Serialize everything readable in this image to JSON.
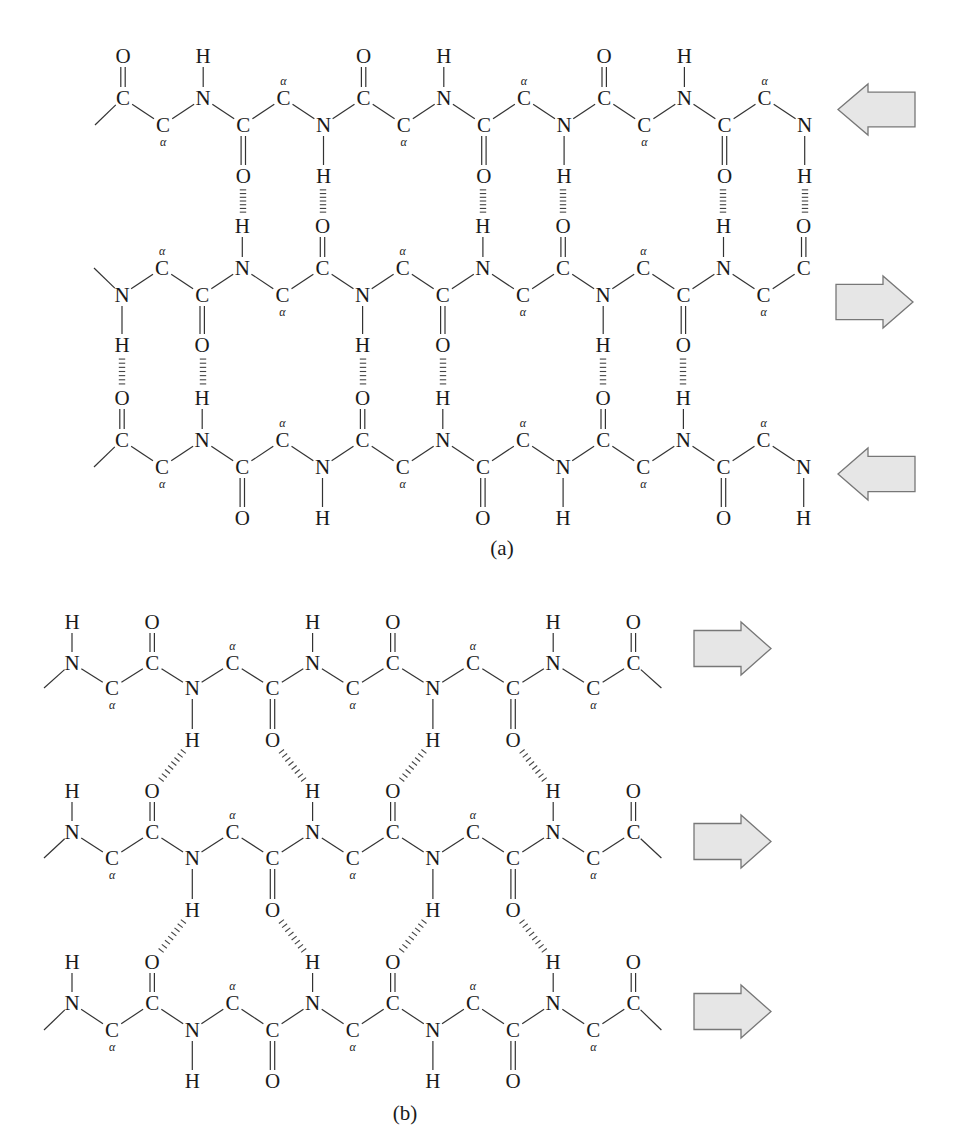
{
  "figure": {
    "colors": {
      "ink": "#1a1a1a",
      "bond": "#333333",
      "arrow_fill": "#e6e6e6",
      "arrow_stroke": "#777777"
    },
    "panels": [
      {
        "id": "a",
        "label": "(a)",
        "label_pos": [
          502,
          555
        ],
        "type": "antiparallel",
        "strands": [
          {
            "direction": "left",
            "y_up": 98,
            "y_dn": 125,
            "y_above": 56,
            "y_below": 176,
            "x0": 123,
            "dx": 40.1,
            "lead_in": "left",
            "atoms": [
              {
                "el": "C",
                "pos": "up",
                "sub": "O"
              },
              {
                "el": "C",
                "pos": "dn",
                "alpha": true
              },
              {
                "el": "N",
                "pos": "up",
                "sub": "H"
              },
              {
                "el": "C",
                "pos": "dn",
                "sub": "O"
              },
              {
                "el": "C",
                "pos": "up",
                "alpha": true
              },
              {
                "el": "N",
                "pos": "dn",
                "sub": "H"
              },
              {
                "el": "C",
                "pos": "up",
                "sub": "O"
              },
              {
                "el": "C",
                "pos": "dn",
                "alpha": true
              },
              {
                "el": "N",
                "pos": "up",
                "sub": "H"
              },
              {
                "el": "C",
                "pos": "dn",
                "sub": "O"
              },
              {
                "el": "C",
                "pos": "up",
                "alpha": true
              },
              {
                "el": "N",
                "pos": "dn",
                "sub": "H"
              },
              {
                "el": "C",
                "pos": "up",
                "sub": "O"
              },
              {
                "el": "C",
                "pos": "dn",
                "alpha": true
              },
              {
                "el": "N",
                "pos": "up",
                "sub": "H"
              },
              {
                "el": "C",
                "pos": "dn",
                "sub": "O"
              },
              {
                "el": "C",
                "pos": "up",
                "alpha": true
              },
              {
                "el": "N",
                "pos": "dn",
                "sub": "H"
              }
            ],
            "arrow": {
              "dir": "left",
              "x": 838,
              "y": 84,
              "w": 77,
              "h": 51
            }
          },
          {
            "direction": "right",
            "y_up": 268,
            "y_dn": 295,
            "y_above": 226,
            "y_below": 345,
            "x0": 122,
            "dx": 40.1,
            "lead_in": "left",
            "atoms": [
              {
                "el": "N",
                "pos": "dn",
                "sub": "H"
              },
              {
                "el": "C",
                "pos": "up",
                "alpha": true
              },
              {
                "el": "C",
                "pos": "dn",
                "sub": "O"
              },
              {
                "el": "N",
                "pos": "up",
                "sub": "H"
              },
              {
                "el": "C",
                "pos": "dn",
                "alpha": true
              },
              {
                "el": "C",
                "pos": "up",
                "sub": "O"
              },
              {
                "el": "N",
                "pos": "dn",
                "sub": "H"
              },
              {
                "el": "C",
                "pos": "up",
                "alpha": true
              },
              {
                "el": "C",
                "pos": "dn",
                "sub": "O"
              },
              {
                "el": "N",
                "pos": "up",
                "sub": "H"
              },
              {
                "el": "C",
                "pos": "dn",
                "alpha": true
              },
              {
                "el": "C",
                "pos": "up",
                "sub": "O"
              },
              {
                "el": "N",
                "pos": "dn",
                "sub": "H"
              },
              {
                "el": "C",
                "pos": "up",
                "alpha": true
              },
              {
                "el": "C",
                "pos": "dn",
                "sub": "O"
              },
              {
                "el": "N",
                "pos": "up",
                "sub": "H"
              },
              {
                "el": "C",
                "pos": "dn",
                "alpha": true
              },
              {
                "el": "C",
                "pos": "up",
                "sub": "O"
              }
            ],
            "arrow": {
              "dir": "right",
              "x": 836,
              "y": 276,
              "w": 77,
              "h": 52
            }
          },
          {
            "direction": "left",
            "y_up": 440,
            "y_dn": 467,
            "y_above": 398,
            "y_below": 518,
            "x0": 122,
            "dx": 40.1,
            "lead_in": "left",
            "atoms": [
              {
                "el": "C",
                "pos": "up",
                "sub": "O"
              },
              {
                "el": "C",
                "pos": "dn",
                "alpha": true
              },
              {
                "el": "N",
                "pos": "up",
                "sub": "H"
              },
              {
                "el": "C",
                "pos": "dn",
                "sub": "O"
              },
              {
                "el": "C",
                "pos": "up",
                "alpha": true
              },
              {
                "el": "N",
                "pos": "dn",
                "sub": "H"
              },
              {
                "el": "C",
                "pos": "up",
                "sub": "O"
              },
              {
                "el": "C",
                "pos": "dn",
                "alpha": true
              },
              {
                "el": "N",
                "pos": "up",
                "sub": "H"
              },
              {
                "el": "C",
                "pos": "dn",
                "sub": "O"
              },
              {
                "el": "C",
                "pos": "up",
                "alpha": true
              },
              {
                "el": "N",
                "pos": "dn",
                "sub": "H"
              },
              {
                "el": "C",
                "pos": "up",
                "sub": "O"
              },
              {
                "el": "C",
                "pos": "dn",
                "alpha": true
              },
              {
                "el": "N",
                "pos": "up",
                "sub": "H"
              },
              {
                "el": "C",
                "pos": "dn",
                "sub": "O"
              },
              {
                "el": "C",
                "pos": "up",
                "alpha": true
              },
              {
                "el": "N",
                "pos": "dn",
                "sub": "H"
              }
            ],
            "arrow": {
              "dir": "left",
              "x": 838,
              "y": 448,
              "w": 77,
              "h": 52
            }
          }
        ],
        "hbonds": [
          {
            "from_strand": 0,
            "to_strand": 1,
            "x": [
              243,
              323,
              483,
              563,
              723,
              805
            ],
            "style": "vertical"
          },
          {
            "from_strand": 1,
            "to_strand": 2,
            "x": [
              122,
              203,
              363,
              443,
              603,
              683
            ],
            "style": "vertical"
          }
        ]
      },
      {
        "id": "b",
        "label": "(b)",
        "label_pos": [
          405,
          1120
        ],
        "type": "parallel",
        "strands": [
          {
            "direction": "right",
            "y_up": 663,
            "y_dn": 688,
            "y_above": 622,
            "y_below": 740,
            "x0": 72,
            "dx": 40.1,
            "lead_in": "left",
            "lead_out": "right",
            "atoms": [
              {
                "el": "N",
                "pos": "up",
                "sub": "H"
              },
              {
                "el": "C",
                "pos": "dn",
                "alpha": true
              },
              {
                "el": "C",
                "pos": "up",
                "sub": "O"
              },
              {
                "el": "N",
                "pos": "dn",
                "sub": "H"
              },
              {
                "el": "C",
                "pos": "up",
                "alpha": true
              },
              {
                "el": "C",
                "pos": "dn",
                "sub": "O"
              },
              {
                "el": "N",
                "pos": "up",
                "sub": "H"
              },
              {
                "el": "C",
                "pos": "dn",
                "alpha": true
              },
              {
                "el": "C",
                "pos": "up",
                "sub": "O"
              },
              {
                "el": "N",
                "pos": "dn",
                "sub": "H"
              },
              {
                "el": "C",
                "pos": "up",
                "alpha": true
              },
              {
                "el": "C",
                "pos": "dn",
                "sub": "O"
              },
              {
                "el": "N",
                "pos": "up",
                "sub": "H"
              },
              {
                "el": "C",
                "pos": "dn",
                "alpha": true
              },
              {
                "el": "C",
                "pos": "up",
                "sub": "O"
              }
            ],
            "arrow": {
              "dir": "right",
              "x": 694,
              "y": 622,
              "w": 77,
              "h": 53
            }
          },
          {
            "direction": "right",
            "y_up": 832,
            "y_dn": 858,
            "y_above": 791,
            "y_below": 910,
            "x0": 72,
            "dx": 40.1,
            "lead_in": "left",
            "lead_out": "right",
            "atoms": [
              {
                "el": "N",
                "pos": "up",
                "sub": "H"
              },
              {
                "el": "C",
                "pos": "dn",
                "alpha": true
              },
              {
                "el": "C",
                "pos": "up",
                "sub": "O"
              },
              {
                "el": "N",
                "pos": "dn",
                "sub": "H"
              },
              {
                "el": "C",
                "pos": "up",
                "alpha": true
              },
              {
                "el": "C",
                "pos": "dn",
                "sub": "O"
              },
              {
                "el": "N",
                "pos": "up",
                "sub": "H"
              },
              {
                "el": "C",
                "pos": "dn",
                "alpha": true
              },
              {
                "el": "C",
                "pos": "up",
                "sub": "O"
              },
              {
                "el": "N",
                "pos": "dn",
                "sub": "H"
              },
              {
                "el": "C",
                "pos": "up",
                "alpha": true
              },
              {
                "el": "C",
                "pos": "dn",
                "sub": "O"
              },
              {
                "el": "N",
                "pos": "up",
                "sub": "H"
              },
              {
                "el": "C",
                "pos": "dn",
                "alpha": true
              },
              {
                "el": "C",
                "pos": "up",
                "sub": "O"
              }
            ],
            "arrow": {
              "dir": "right",
              "x": 694,
              "y": 815,
              "w": 77,
              "h": 53
            }
          },
          {
            "direction": "right",
            "y_up": 1003,
            "y_dn": 1030,
            "y_above": 962,
            "y_below": 1081,
            "x0": 72,
            "dx": 40.1,
            "lead_in": "left",
            "lead_out": "right",
            "atoms": [
              {
                "el": "N",
                "pos": "up",
                "sub": "H"
              },
              {
                "el": "C",
                "pos": "dn",
                "alpha": true
              },
              {
                "el": "C",
                "pos": "up",
                "sub": "O"
              },
              {
                "el": "N",
                "pos": "dn",
                "sub": "H"
              },
              {
                "el": "C",
                "pos": "up",
                "alpha": true
              },
              {
                "el": "C",
                "pos": "dn",
                "sub": "O"
              },
              {
                "el": "N",
                "pos": "up",
                "sub": "H"
              },
              {
                "el": "C",
                "pos": "dn",
                "alpha": true
              },
              {
                "el": "C",
                "pos": "up",
                "sub": "O"
              },
              {
                "el": "N",
                "pos": "dn",
                "sub": "H"
              },
              {
                "el": "C",
                "pos": "up",
                "alpha": true
              },
              {
                "el": "C",
                "pos": "dn",
                "sub": "O"
              },
              {
                "el": "N",
                "pos": "up",
                "sub": "H"
              },
              {
                "el": "C",
                "pos": "dn",
                "alpha": true
              },
              {
                "el": "C",
                "pos": "up",
                "sub": "O"
              }
            ],
            "arrow": {
              "dir": "right",
              "x": 694,
              "y": 985,
              "w": 77,
              "h": 53
            }
          }
        ],
        "hbonds": [
          {
            "from_strand": 0,
            "to_strand": 1,
            "pairs": [
              [
                3,
                2
              ],
              [
                5,
                6
              ],
              [
                9,
                8
              ],
              [
                11,
                12
              ]
            ],
            "style": "diagonal"
          },
          {
            "from_strand": 1,
            "to_strand": 2,
            "pairs": [
              [
                3,
                2
              ],
              [
                5,
                6
              ],
              [
                9,
                8
              ],
              [
                11,
                12
              ]
            ],
            "style": "diagonal"
          }
        ]
      }
    ]
  }
}
